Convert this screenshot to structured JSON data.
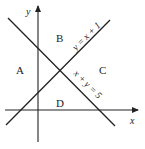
{
  "diagram": {
    "type": "coordinate-plane-regions",
    "axes": {
      "x_label": "x",
      "y_label": "y"
    },
    "lines": [
      {
        "equation": "y = x + 1",
        "label": "y = x + 1"
      },
      {
        "equation": "x + y = 5",
        "label": "x + y = 5"
      }
    ],
    "regions": [
      {
        "label": "A",
        "position": "left"
      },
      {
        "label": "B",
        "position": "top"
      },
      {
        "label": "C",
        "position": "right"
      },
      {
        "label": "D",
        "position": "bottom"
      }
    ],
    "colors": {
      "stroke": "#222222",
      "background": "#ffffff"
    }
  }
}
